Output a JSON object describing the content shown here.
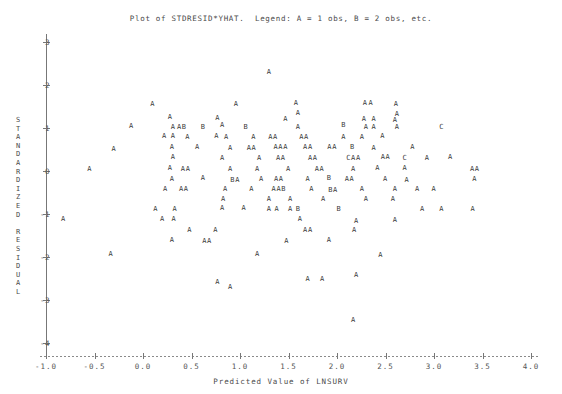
{
  "chart_data": {
    "type": "scatter",
    "title": "Plot of STDRESID*YHAT.  Legend: A = 1 obs, B = 2 obs, etc.",
    "xlabel": "Predicted Value of LNSURV",
    "ylabel": "STANDARDIZED RESIDUAL",
    "xlim": [
      -1.0,
      4.0
    ],
    "ylim": [
      -4.3,
      3.4
    ],
    "xticks": [
      -1.0,
      -0.5,
      0.0,
      0.5,
      1.0,
      1.5,
      2.0,
      2.5,
      3.0,
      3.5,
      4.0
    ],
    "xticklabels": [
      "-1.0",
      "-0.5",
      "0.0",
      "0.5",
      "1.0",
      "1.5",
      "2.0",
      "2.5",
      "3.0",
      "3.5",
      "4.0"
    ],
    "yticks": [
      3,
      2,
      1,
      0,
      -1,
      -2,
      -3,
      -4
    ],
    "yticklabels": [
      "3",
      "2",
      "1",
      "0",
      "-1",
      "-2",
      "-3",
      "-4"
    ],
    "grid": false,
    "legend": "A = 1 obs, B = 2 obs, etc.",
    "marker_meaning": {
      "A": 1,
      "B": 2,
      "C": 3
    },
    "points": [
      {
        "x": 1.3,
        "y": 2.3,
        "label": "A"
      },
      {
        "x": 0.1,
        "y": 1.55,
        "label": "A"
      },
      {
        "x": 0.96,
        "y": 1.55,
        "label": "A"
      },
      {
        "x": 1.58,
        "y": 1.57,
        "label": "A"
      },
      {
        "x": 2.29,
        "y": 1.58,
        "label": "A"
      },
      {
        "x": 2.35,
        "y": 1.58,
        "label": "A"
      },
      {
        "x": 2.61,
        "y": 1.56,
        "label": "A"
      },
      {
        "x": 1.6,
        "y": 1.36,
        "label": "A"
      },
      {
        "x": 2.62,
        "y": 1.33,
        "label": "A"
      },
      {
        "x": 0.28,
        "y": 1.25,
        "label": "A"
      },
      {
        "x": 0.77,
        "y": 1.23,
        "label": "A"
      },
      {
        "x": 1.47,
        "y": 1.22,
        "label": "A"
      },
      {
        "x": 2.28,
        "y": 1.22,
        "label": "A"
      },
      {
        "x": 2.38,
        "y": 1.22,
        "label": "A"
      },
      {
        "x": 2.6,
        "y": 1.18,
        "label": "A"
      },
      {
        "x": 0.82,
        "y": 1.08,
        "label": "A"
      },
      {
        "x": -0.12,
        "y": 1.04,
        "label": "A"
      },
      {
        "x": 0.31,
        "y": 1.03,
        "label": "A"
      },
      {
        "x": 0.4,
        "y": 1.03,
        "label": "AB"
      },
      {
        "x": 0.62,
        "y": 1.03,
        "label": "B"
      },
      {
        "x": 1.06,
        "y": 1.02,
        "label": "B"
      },
      {
        "x": 1.6,
        "y": 1.02,
        "label": "A"
      },
      {
        "x": 2.07,
        "y": 1.06,
        "label": "B"
      },
      {
        "x": 2.3,
        "y": 1.03,
        "label": "A"
      },
      {
        "x": 2.38,
        "y": 1.03,
        "label": "A"
      },
      {
        "x": 2.62,
        "y": 1.03,
        "label": "A"
      },
      {
        "x": 3.08,
        "y": 1.02,
        "label": "C"
      },
      {
        "x": 0.22,
        "y": 0.82,
        "label": "A"
      },
      {
        "x": 0.31,
        "y": 0.82,
        "label": "A"
      },
      {
        "x": 0.46,
        "y": 0.8,
        "label": "A"
      },
      {
        "x": 0.76,
        "y": 0.82,
        "label": "A"
      },
      {
        "x": 0.86,
        "y": 0.8,
        "label": "A"
      },
      {
        "x": 1.14,
        "y": 0.8,
        "label": "A"
      },
      {
        "x": 1.34,
        "y": 0.8,
        "label": "AA"
      },
      {
        "x": 1.66,
        "y": 0.8,
        "label": "AA"
      },
      {
        "x": 2.07,
        "y": 0.8,
        "label": "A"
      },
      {
        "x": 2.26,
        "y": 0.8,
        "label": "A"
      },
      {
        "x": 2.47,
        "y": 0.82,
        "label": "A"
      },
      {
        "x": -0.3,
        "y": 0.52,
        "label": "A"
      },
      {
        "x": 0.3,
        "y": 0.56,
        "label": "A"
      },
      {
        "x": 0.56,
        "y": 0.55,
        "label": "A"
      },
      {
        "x": 0.9,
        "y": 0.54,
        "label": "A"
      },
      {
        "x": 1.12,
        "y": 0.54,
        "label": "AA"
      },
      {
        "x": 1.42,
        "y": 0.56,
        "label": "AAA"
      },
      {
        "x": 1.7,
        "y": 0.56,
        "label": "AA"
      },
      {
        "x": 1.95,
        "y": 0.56,
        "label": "AA"
      },
      {
        "x": 2.16,
        "y": 0.56,
        "label": "B"
      },
      {
        "x": 2.38,
        "y": 0.54,
        "label": "A"
      },
      {
        "x": 2.78,
        "y": 0.55,
        "label": "A"
      },
      {
        "x": 0.31,
        "y": 0.32,
        "label": "A"
      },
      {
        "x": 0.82,
        "y": 0.31,
        "label": "A"
      },
      {
        "x": 1.2,
        "y": 0.3,
        "label": "A"
      },
      {
        "x": 1.42,
        "y": 0.3,
        "label": "AA"
      },
      {
        "x": 1.75,
        "y": 0.31,
        "label": "AA"
      },
      {
        "x": 2.17,
        "y": 0.3,
        "label": "CAA"
      },
      {
        "x": 2.5,
        "y": 0.32,
        "label": "AA"
      },
      {
        "x": 2.7,
        "y": 0.3,
        "label": "C"
      },
      {
        "x": 2.93,
        "y": 0.3,
        "label": "A"
      },
      {
        "x": 3.17,
        "y": 0.32,
        "label": "A"
      },
      {
        "x": -0.55,
        "y": 0.05,
        "label": "A"
      },
      {
        "x": 0.28,
        "y": 0.06,
        "label": "A"
      },
      {
        "x": 0.44,
        "y": 0.05,
        "label": "AA"
      },
      {
        "x": 0.9,
        "y": 0.05,
        "label": "A"
      },
      {
        "x": 1.18,
        "y": 0.05,
        "label": "A"
      },
      {
        "x": 1.5,
        "y": 0.05,
        "label": "A"
      },
      {
        "x": 1.82,
        "y": 0.05,
        "label": "AA"
      },
      {
        "x": 2.17,
        "y": 0.05,
        "label": "A"
      },
      {
        "x": 2.42,
        "y": 0.06,
        "label": "A"
      },
      {
        "x": 2.7,
        "y": 0.06,
        "label": "A"
      },
      {
        "x": 3.42,
        "y": 0.05,
        "label": "AA"
      },
      {
        "x": 0.3,
        "y": -0.18,
        "label": "A"
      },
      {
        "x": 0.62,
        "y": -0.16,
        "label": "A"
      },
      {
        "x": 0.95,
        "y": -0.2,
        "label": "BA"
      },
      {
        "x": 1.22,
        "y": -0.18,
        "label": "A"
      },
      {
        "x": 1.4,
        "y": -0.18,
        "label": "AA"
      },
      {
        "x": 1.7,
        "y": -0.18,
        "label": "A"
      },
      {
        "x": 1.92,
        "y": -0.16,
        "label": "B"
      },
      {
        "x": 2.13,
        "y": -0.18,
        "label": "AA"
      },
      {
        "x": 2.5,
        "y": -0.18,
        "label": "A"
      },
      {
        "x": 2.72,
        "y": -0.2,
        "label": "A"
      },
      {
        "x": 3.42,
        "y": -0.18,
        "label": "A"
      },
      {
        "x": 0.23,
        "y": -0.42,
        "label": "A"
      },
      {
        "x": 0.42,
        "y": -0.42,
        "label": "AA"
      },
      {
        "x": 0.85,
        "y": -0.43,
        "label": "A"
      },
      {
        "x": 1.12,
        "y": -0.42,
        "label": "A"
      },
      {
        "x": 1.4,
        "y": -0.42,
        "label": "AAB"
      },
      {
        "x": 1.74,
        "y": -0.42,
        "label": "A"
      },
      {
        "x": 1.96,
        "y": -0.45,
        "label": "BA"
      },
      {
        "x": 2.26,
        "y": -0.42,
        "label": "A"
      },
      {
        "x": 2.6,
        "y": -0.42,
        "label": "A"
      },
      {
        "x": 2.83,
        "y": -0.42,
        "label": "A"
      },
      {
        "x": 3.0,
        "y": -0.42,
        "label": "A"
      },
      {
        "x": 0.83,
        "y": -0.64,
        "label": "A"
      },
      {
        "x": 1.3,
        "y": -0.64,
        "label": "A"
      },
      {
        "x": 1.52,
        "y": -0.64,
        "label": "A"
      },
      {
        "x": 1.86,
        "y": -0.66,
        "label": "A"
      },
      {
        "x": 2.3,
        "y": -0.64,
        "label": "A"
      },
      {
        "x": 2.58,
        "y": -0.64,
        "label": "A"
      },
      {
        "x": 0.13,
        "y": -0.88,
        "label": "A"
      },
      {
        "x": 0.33,
        "y": -0.88,
        "label": "A"
      },
      {
        "x": 0.82,
        "y": -0.86,
        "label": "A"
      },
      {
        "x": 1.04,
        "y": -0.86,
        "label": "A"
      },
      {
        "x": 1.3,
        "y": -0.88,
        "label": "A"
      },
      {
        "x": 1.38,
        "y": -0.88,
        "label": "A"
      },
      {
        "x": 1.52,
        "y": -0.88,
        "label": "A"
      },
      {
        "x": 1.6,
        "y": -0.88,
        "label": "B"
      },
      {
        "x": 2.02,
        "y": -0.88,
        "label": "B"
      },
      {
        "x": 2.88,
        "y": -0.88,
        "label": "A"
      },
      {
        "x": 3.08,
        "y": -0.88,
        "label": "A"
      },
      {
        "x": 3.4,
        "y": -0.88,
        "label": "A"
      },
      {
        "x": -0.82,
        "y": -1.12,
        "label": "A"
      },
      {
        "x": 0.2,
        "y": -1.12,
        "label": "A"
      },
      {
        "x": 0.32,
        "y": -1.12,
        "label": "A"
      },
      {
        "x": 1.62,
        "y": -1.12,
        "label": "A"
      },
      {
        "x": 2.2,
        "y": -1.16,
        "label": "A"
      },
      {
        "x": 2.6,
        "y": -1.14,
        "label": "A"
      },
      {
        "x": 0.48,
        "y": -1.38,
        "label": "A"
      },
      {
        "x": 0.75,
        "y": -1.38,
        "label": "A"
      },
      {
        "x": 1.7,
        "y": -1.38,
        "label": "AA"
      },
      {
        "x": 2.18,
        "y": -1.38,
        "label": "A"
      },
      {
        "x": 0.3,
        "y": -1.6,
        "label": "A"
      },
      {
        "x": 0.66,
        "y": -1.62,
        "label": "AA"
      },
      {
        "x": 1.48,
        "y": -1.62,
        "label": "A"
      },
      {
        "x": 1.92,
        "y": -1.6,
        "label": "A"
      },
      {
        "x": -0.33,
        "y": -1.94,
        "label": "A"
      },
      {
        "x": 1.18,
        "y": -1.92,
        "label": "A"
      },
      {
        "x": 2.45,
        "y": -1.95,
        "label": "A"
      },
      {
        "x": 0.77,
        "y": -2.58,
        "label": "A"
      },
      {
        "x": 0.9,
        "y": -2.7,
        "label": "A"
      },
      {
        "x": 1.7,
        "y": -2.5,
        "label": "A"
      },
      {
        "x": 1.85,
        "y": -2.5,
        "label": "A"
      },
      {
        "x": 2.2,
        "y": -2.42,
        "label": "A"
      },
      {
        "x": 2.17,
        "y": -3.46,
        "label": "A"
      }
    ]
  }
}
